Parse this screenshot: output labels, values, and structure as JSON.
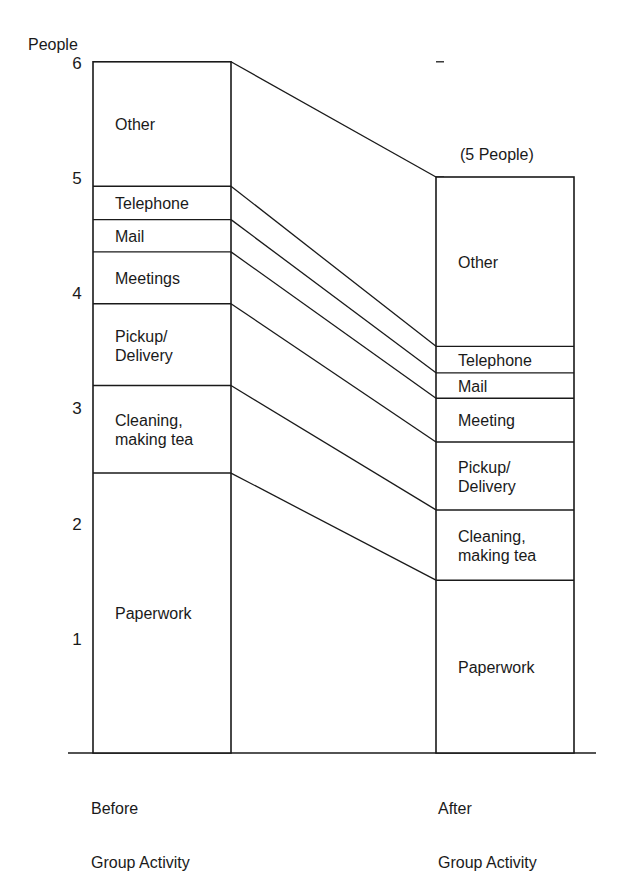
{
  "chart_data": {
    "type": "bar",
    "subtype": "stacked-bar-with-connectors",
    "title": "",
    "ylabel": "People",
    "xlabel": "",
    "ylim": [
      0,
      6.2
    ],
    "yticks": [
      1,
      2,
      3,
      4,
      5,
      6
    ],
    "grid": false,
    "legend": "none (segments labeled inline)",
    "categories": [
      "Before\nGroup Activity",
      "After\nGroup Activity"
    ],
    "annotations": [
      {
        "bar": 1,
        "text": "(5 People)",
        "position": "above"
      }
    ],
    "segments": [
      "Paperwork",
      "Cleaning, making tea",
      "Pickup/ Delivery",
      "Meetings",
      "Mail",
      "Telephone",
      "Other"
    ],
    "series": [
      {
        "name": "Paperwork",
        "values": [
          2.43,
          1.5
        ]
      },
      {
        "name": "Cleaning, making tea",
        "values": [
          0.76,
          0.61
        ]
      },
      {
        "name": "Pickup/Delivery",
        "values": [
          0.71,
          0.59
        ]
      },
      {
        "name": "Meetings",
        "values": [
          0.45,
          0.38
        ]
      },
      {
        "name": "Mail",
        "values": [
          0.28,
          0.22
        ]
      },
      {
        "name": "Telephone",
        "values": [
          0.29,
          0.23
        ]
      },
      {
        "name": "Other",
        "values": [
          1.08,
          1.47
        ]
      }
    ],
    "totals": [
      6.0,
      5.0
    ]
  },
  "labels": {
    "ylabel": "People",
    "annotation": "(5 People)",
    "before": {
      "x_label_line1": "Before",
      "x_label_line2": "Group Activity",
      "segments": [
        {
          "text1": "Paperwork",
          "text2": ""
        },
        {
          "text1": "Cleaning,",
          "text2": "making tea"
        },
        {
          "text1": "Pickup/",
          "text2": "Delivery"
        },
        {
          "text1": "Meetings",
          "text2": ""
        },
        {
          "text1": "Mail",
          "text2": ""
        },
        {
          "text1": "Telephone",
          "text2": ""
        },
        {
          "text1": "Other",
          "text2": ""
        }
      ]
    },
    "after": {
      "x_label_line1": "After",
      "x_label_line2": "Group Activity",
      "segments": [
        {
          "text1": "Paperwork",
          "text2": ""
        },
        {
          "text1": "Cleaning,",
          "text2": "making tea"
        },
        {
          "text1": "Pickup/",
          "text2": "Delivery"
        },
        {
          "text1": "Meeting",
          "text2": ""
        },
        {
          "text1": "Mail",
          "text2": ""
        },
        {
          "text1": "Telephone",
          "text2": ""
        },
        {
          "text1": "Other",
          "text2": ""
        }
      ]
    }
  }
}
